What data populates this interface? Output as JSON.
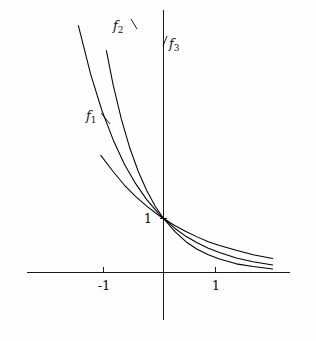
{
  "figure": {
    "title": "",
    "background_color": "#fefefe",
    "axis_color": "#1a1a1a",
    "curve_color": "#000000"
  },
  "axes": {
    "x_axis_label": "",
    "y_axis_label": "",
    "x_ticks": [
      {
        "value": -1,
        "label": "-1"
      },
      {
        "value": 1,
        "label": "1"
      }
    ],
    "y_ticks": [
      {
        "value": 1,
        "label": "1"
      }
    ]
  },
  "labels": {
    "f1": {
      "base": "f",
      "sub": "1"
    },
    "f2": {
      "base": "f",
      "sub": "2"
    },
    "f3": {
      "base": "f",
      "sub": "3"
    },
    "y_one": "1",
    "x_minus_one": "-1",
    "x_one": "1"
  },
  "chart_data": {
    "type": "line",
    "title": "",
    "xlabel": "",
    "ylabel": "",
    "xlim": [
      -2.45,
      2.27
    ],
    "ylim": [
      -0.9,
      4.85
    ],
    "grid": false,
    "legend": "inline-curve-labels",
    "annotations": [
      {
        "text": "f_1",
        "x": -1.35,
        "y": 2.9
      },
      {
        "text": "f_2",
        "x": -0.85,
        "y": 4.6
      },
      {
        "text": "f_3",
        "x": 0.13,
        "y": 4.25
      }
    ],
    "series": [
      {
        "name": "f_1",
        "formula": "2^(-x)",
        "x": [
          -1.12,
          -0.9,
          -0.7,
          -0.5,
          -0.3,
          -0.1,
          0,
          0.2,
          0.4,
          0.6,
          0.8,
          1.0,
          1.3,
          1.6,
          1.95
        ],
        "values": [
          2.17,
          1.87,
          1.62,
          1.41,
          1.23,
          1.07,
          1.0,
          0.87,
          0.76,
          0.66,
          0.57,
          0.5,
          0.41,
          0.33,
          0.26
        ]
      },
      {
        "name": "f_2",
        "formula": "e^(-x)",
        "x": [
          -1.52,
          -1.3,
          -1.1,
          -0.9,
          -0.7,
          -0.5,
          -0.3,
          -0.1,
          0,
          0.2,
          0.4,
          0.6,
          0.8,
          1.0,
          1.3,
          1.6,
          1.95
        ],
        "values": [
          4.57,
          3.67,
          3.0,
          2.46,
          2.01,
          1.65,
          1.35,
          1.11,
          1.0,
          0.82,
          0.67,
          0.55,
          0.45,
          0.37,
          0.27,
          0.2,
          0.14
        ]
      },
      {
        "name": "f_3",
        "formula": "4^(-x)",
        "x": [
          -1.02,
          -0.9,
          -0.75,
          -0.6,
          -0.45,
          -0.3,
          -0.15,
          0,
          0.2,
          0.4,
          0.6,
          0.8,
          1.0,
          1.3,
          1.6,
          1.95
        ],
        "values": [
          4.11,
          3.48,
          2.83,
          2.3,
          1.87,
          1.52,
          1.23,
          1.0,
          0.76,
          0.57,
          0.43,
          0.33,
          0.25,
          0.16,
          0.11,
          0.066
        ]
      }
    ]
  }
}
